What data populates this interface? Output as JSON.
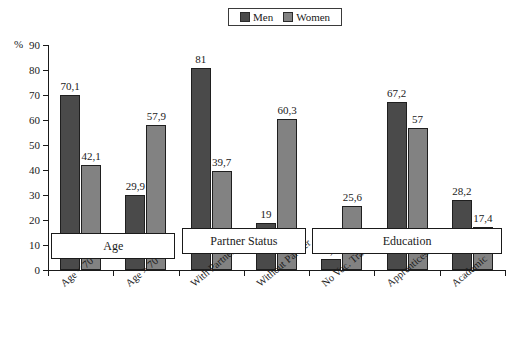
{
  "chart_data": {
    "type": "bar",
    "title": "",
    "xlabel": "",
    "ylabel": "%",
    "ylim": [
      0,
      90
    ],
    "ytick_step": 10,
    "yticks": [
      0,
      10,
      20,
      30,
      40,
      50,
      60,
      70,
      80,
      90
    ],
    "grid": false,
    "legend_position": "top-center",
    "categories": [
      "Age < 70",
      "Age > 70",
      "With Partner",
      "Without Partner",
      "No Voc. Training",
      "Apprenticeship",
      "Academic"
    ],
    "series": [
      {
        "name": "Men",
        "color": "#4a4a4a",
        "values": [
          70.1,
          29.9,
          81,
          19,
          4.6,
          67.2,
          28.2
        ],
        "labels": [
          "70,1",
          "29,9",
          "81",
          "19",
          "4,6",
          "67,2",
          "28,2"
        ]
      },
      {
        "name": "Women",
        "color": "#828282",
        "values": [
          42.1,
          57.9,
          39.7,
          60.3,
          25.6,
          57,
          17.4
        ],
        "labels": [
          "42,1",
          "57,9",
          "39,7",
          "60,3",
          "25,6",
          "57",
          "17,4"
        ]
      }
    ],
    "annotations": [
      {
        "text": "Age",
        "covers": [
          "Age < 70",
          "Age > 70"
        ]
      },
      {
        "text": "Partner Status",
        "covers": [
          "With Partner",
          "Without Partner"
        ]
      },
      {
        "text": "Education",
        "covers": [
          "No Voc. Training",
          "Apprenticeship",
          "Academic"
        ]
      }
    ]
  },
  "legend": {
    "entries": [
      {
        "label": "Men",
        "color": "#4a4a4a"
      },
      {
        "label": "Women",
        "color": "#828282"
      }
    ]
  },
  "axis": {
    "y_unit": "%",
    "y_labels": [
      "90",
      "80",
      "70",
      "60",
      "50",
      "40",
      "30",
      "20",
      "10",
      "0"
    ]
  }
}
